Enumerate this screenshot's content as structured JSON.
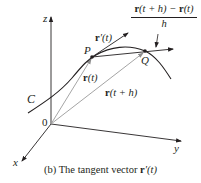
{
  "figure": {
    "caption": {
      "prefix": "(b) The tangent vector ",
      "vector": "r",
      "suffix": "′(t)"
    },
    "axes": {
      "x_label": "x",
      "y_label": "y",
      "z_label": "z",
      "origin_label": "0"
    },
    "curve_label": "C",
    "points": {
      "P": "P",
      "Q": "Q"
    },
    "vectors": {
      "r_t": {
        "bold": "r",
        "rest": "(t)"
      },
      "r_t_plus_h": {
        "bold": "r",
        "rest": "(t + h)"
      },
      "r_prime": {
        "bold": "r",
        "rest": "′(t)"
      }
    },
    "difference_quotient": {
      "numerator_bold_1": "r",
      "numerator_mid": "(t + h) − ",
      "numerator_bold_2": "r",
      "numerator_end": "(t)",
      "denominator": "h"
    },
    "colors": {
      "ink": "#231f20",
      "position_vectors": "#9a9a9a",
      "background": "#ffffff"
    }
  }
}
